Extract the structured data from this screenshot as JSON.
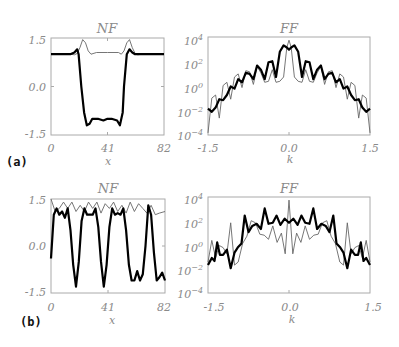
{
  "figure": {
    "panels": [
      {
        "label": "(a)"
      },
      {
        "label": "(b)"
      }
    ]
  },
  "chart_data": [
    {
      "panel": "(a)",
      "type": "line",
      "title": "NF",
      "xlabel": "x",
      "ylabel": "",
      "xlim": [
        0,
        82
      ],
      "ylim": [
        -1.5,
        1.5
      ],
      "xticks": [
        "0",
        "41",
        "82"
      ],
      "yticks": [
        "1.5",
        "0.0",
        "-1.5"
      ],
      "series": [
        {
          "name": "thick",
          "x": [
            0,
            14,
            17,
            19,
            20,
            22,
            24,
            26,
            28,
            30,
            34,
            38,
            41,
            44,
            48,
            50,
            52,
            53,
            55,
            57,
            59,
            61,
            64,
            70,
            82
          ],
          "values": [
            1.0,
            1.0,
            1.05,
            1.15,
            1.0,
            0.0,
            -0.8,
            -1.2,
            -1.15,
            -1.0,
            -1.0,
            -1.05,
            -1.0,
            -1.0,
            -1.05,
            -1.2,
            -0.8,
            0.0,
            1.0,
            1.15,
            1.05,
            1.0,
            1.0,
            1.0,
            1.0
          ]
        },
        {
          "name": "thin",
          "x": [
            0,
            14,
            17,
            19,
            21,
            23,
            25,
            27,
            29,
            33,
            37,
            41,
            45,
            49,
            51,
            53,
            55,
            57,
            59,
            61,
            63,
            66,
            70,
            82
          ],
          "values": [
            1.0,
            1.0,
            0.98,
            1.02,
            1.2,
            1.45,
            1.35,
            1.1,
            1.0,
            1.05,
            1.05,
            1.05,
            1.05,
            1.05,
            1.0,
            1.1,
            1.35,
            1.45,
            1.2,
            1.02,
            0.98,
            1.0,
            1.0,
            1.0
          ]
        }
      ]
    },
    {
      "panel": "(a)",
      "type": "line",
      "title": "FF",
      "xlabel": "k",
      "ylabel": "",
      "yscale": "log",
      "xlim": [
        -1.5,
        1.5
      ],
      "ylim": [
        1e-05,
        10000.0
      ],
      "xticks": [
        "-1.5",
        "0.0",
        "1.5"
      ],
      "yticks": [
        "10^4",
        "10^2",
        "10^0",
        "10^-2",
        "10^-4"
      ],
      "series": [
        {
          "name": "thick",
          "x_log10": true,
          "x": [
            -1.5,
            -1.43,
            -1.36,
            -1.29,
            -1.22,
            -1.15,
            -1.08,
            -1.01,
            -0.94,
            -0.87,
            -0.8,
            -0.73,
            -0.66,
            -0.59,
            -0.52,
            -0.45,
            -0.38,
            -0.31,
            -0.24,
            -0.17,
            -0.1,
            -0.04,
            0.0,
            0.04,
            0.1,
            0.17,
            0.24,
            0.31,
            0.38,
            0.45,
            0.52,
            0.59,
            0.66,
            0.73,
            0.8,
            0.87,
            0.94,
            1.01,
            1.08,
            1.15,
            1.22,
            1.29,
            1.36,
            1.43,
            1.5
          ],
          "values": [
            -2.5,
            -2.8,
            -2.4,
            -1.6,
            -1.7,
            -1.2,
            -0.4,
            -0.6,
            0.3,
            0.0,
            0.9,
            0.8,
            0.3,
            1.6,
            1.2,
            0.3,
            1.9,
            2.0,
            0.5,
            2.9,
            3.5,
            3.3,
            3.1,
            3.3,
            3.5,
            2.9,
            0.5,
            2.0,
            1.9,
            0.3,
            1.2,
            1.6,
            0.3,
            0.8,
            0.9,
            0.0,
            0.3,
            -0.6,
            -0.4,
            -1.2,
            -1.7,
            -1.6,
            -2.4,
            -2.8,
            -2.5
          ]
        },
        {
          "name": "thin",
          "x": [
            -1.5,
            -1.43,
            -1.36,
            -1.29,
            -1.22,
            -1.15,
            -1.08,
            -1.01,
            -0.94,
            -0.87,
            -0.8,
            -0.73,
            -0.66,
            -0.59,
            -0.52,
            -0.45,
            -0.38,
            -0.31,
            -0.24,
            -0.17,
            -0.1,
            -0.04,
            0.0,
            0.04,
            0.1,
            0.17,
            0.24,
            0.31,
            0.38,
            0.45,
            0.52,
            0.59,
            0.66,
            0.73,
            0.8,
            0.87,
            0.94,
            1.01,
            1.08,
            1.15,
            1.22,
            1.29,
            1.36,
            1.43,
            1.5
          ],
          "values": [
            -4.8,
            -1.5,
            -1.2,
            -3.4,
            -0.3,
            0.0,
            -1.6,
            0.5,
            0.8,
            -0.5,
            1.1,
            1.0,
            -0.2,
            1.5,
            0.9,
            0.0,
            0.1,
            1.2,
            0.0,
            0.1,
            0.5,
            3.3,
            4.0,
            3.3,
            0.5,
            0.1,
            0.0,
            1.2,
            0.1,
            0.0,
            0.9,
            1.5,
            -0.2,
            1.0,
            1.1,
            -0.5,
            0.8,
            0.5,
            -1.6,
            0.0,
            -0.3,
            -3.4,
            -1.2,
            -1.5,
            -4.8
          ]
        }
      ]
    },
    {
      "panel": "(b)",
      "type": "line",
      "title": "NF",
      "xlabel": "x",
      "ylabel": "",
      "xlim": [
        0,
        82
      ],
      "ylim": [
        -1.5,
        1.5
      ],
      "xticks": [
        "0",
        "41",
        "82"
      ],
      "yticks": [
        "1.5",
        "0.0",
        "-1.5"
      ],
      "series": [
        {
          "name": "thick",
          "x": [
            0,
            2,
            4,
            6,
            8,
            10,
            12,
            14,
            16,
            18,
            20,
            22,
            24,
            26,
            28,
            30,
            32,
            34,
            36,
            38,
            40,
            42,
            44,
            46,
            48,
            50,
            52,
            54,
            56,
            58,
            60,
            62,
            64,
            66,
            68,
            70,
            72,
            74,
            76,
            78,
            80,
            82
          ],
          "values": [
            -0.4,
            1.0,
            1.2,
            1.0,
            1.1,
            0.9,
            1.2,
            0.5,
            -0.6,
            -1.3,
            -0.5,
            0.8,
            1.2,
            1.0,
            1.0,
            1.0,
            1.2,
            0.6,
            -0.5,
            -1.3,
            -0.6,
            0.6,
            1.2,
            1.0,
            1.05,
            1.0,
            1.2,
            0.5,
            -0.6,
            -1.1,
            -1.1,
            -0.8,
            -1.1,
            -0.9,
            0.0,
            1.3,
            1.0,
            -0.2,
            -1.1,
            -1.0,
            -0.85,
            -1.1
          ]
        },
        {
          "name": "thin",
          "x": [
            0,
            3,
            6,
            9,
            12,
            15,
            18,
            21,
            24,
            27,
            30,
            33,
            36,
            39,
            42,
            45,
            48,
            51,
            54,
            57,
            60,
            63,
            66,
            69,
            72,
            75,
            78,
            82
          ],
          "values": [
            1.5,
            1.1,
            1.2,
            1.4,
            1.2,
            1.4,
            1.1,
            1.3,
            1.1,
            1.4,
            1.2,
            1.4,
            1.05,
            1.35,
            1.2,
            1.4,
            1.1,
            1.3,
            1.05,
            1.4,
            1.1,
            1.35,
            1.2,
            1.05,
            1.3,
            1.0,
            1.05,
            1.1
          ]
        }
      ]
    },
    {
      "panel": "(b)",
      "type": "line",
      "title": "FF",
      "xlabel": "k",
      "ylabel": "",
      "yscale": "log",
      "xlim": [
        -1.5,
        1.5
      ],
      "ylim": [
        1e-05,
        10000.0
      ],
      "xticks": [
        "-1.5",
        "0.0",
        "1.5"
      ],
      "yticks": [
        "10^4",
        "10^2",
        "10^0",
        "10^-2",
        "10^-4"
      ],
      "series": [
        {
          "name": "thick",
          "x": [
            -1.5,
            -1.43,
            -1.38,
            -1.33,
            -1.28,
            -1.22,
            -1.15,
            -1.08,
            -1.01,
            -0.95,
            -0.88,
            -0.82,
            -0.75,
            -0.68,
            -0.6,
            -0.52,
            -0.45,
            -0.38,
            -0.3,
            -0.23,
            -0.16,
            -0.08,
            0.0,
            0.08,
            0.16,
            0.23,
            0.3,
            0.38,
            0.45,
            0.52,
            0.6,
            0.68,
            0.75,
            0.82,
            0.88,
            0.95,
            1.01,
            1.08,
            1.15,
            1.22,
            1.28,
            1.33,
            1.38,
            1.43,
            1.5
          ],
          "values": [
            -2.3,
            -1.6,
            -1.9,
            -0.1,
            -1.3,
            -1.3,
            -0.8,
            -2.6,
            -1.1,
            -0.6,
            -0.2,
            2.5,
            0.9,
            1.5,
            1.7,
            1.2,
            3.2,
            1.7,
            1.8,
            2.5,
            1.6,
            2.2,
            1.8,
            2.2,
            1.6,
            2.5,
            1.8,
            1.7,
            3.2,
            1.2,
            1.7,
            1.5,
            0.9,
            2.5,
            -0.2,
            -0.6,
            -1.1,
            -2.6,
            -0.8,
            -1.3,
            -1.3,
            -0.1,
            -1.9,
            -1.6,
            -2.3
          ]
        },
        {
          "name": "thin",
          "x": [
            -1.5,
            -1.43,
            -1.36,
            -1.29,
            -1.22,
            -1.15,
            -1.08,
            -1.01,
            -0.94,
            -0.86,
            -0.78,
            -0.7,
            -0.62,
            -0.54,
            -0.46,
            -0.38,
            -0.3,
            -0.22,
            -0.14,
            -0.07,
            0.0,
            0.07,
            0.14,
            0.22,
            0.3,
            0.38,
            0.46,
            0.54,
            0.62,
            0.7,
            0.78,
            0.86,
            0.94,
            1.01,
            1.08,
            1.15,
            1.22,
            1.29,
            1.36,
            1.43,
            1.5
          ],
          "values": [
            -2.0,
            0.1,
            -1.6,
            -0.4,
            -0.6,
            -1.2,
            1.8,
            -2.3,
            -2.0,
            -0.2,
            0.5,
            2.0,
            1.8,
            0.7,
            0.6,
            0.2,
            1.5,
            -0.1,
            0.8,
            -1.2,
            4.0,
            -1.2,
            0.8,
            -0.1,
            1.5,
            0.2,
            0.6,
            0.7,
            1.8,
            2.0,
            0.5,
            -0.2,
            -2.0,
            -2.3,
            1.8,
            -1.2,
            -0.6,
            -0.4,
            -1.6,
            0.1,
            -2.0
          ]
        }
      ]
    }
  ]
}
